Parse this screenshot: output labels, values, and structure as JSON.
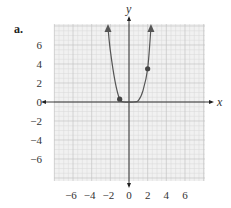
{
  "part_label": "a.",
  "chart_data": {
    "type": "line",
    "title": "",
    "xlabel": "x",
    "ylabel": "y",
    "xlim": [
      -8,
      8
    ],
    "ylim": [
      -8,
      8
    ],
    "grid": true,
    "minor_grid_step": 0.5,
    "major_grid_step": 2,
    "x_ticks": [
      -6,
      -4,
      -2,
      0,
      2,
      4,
      6
    ],
    "x_tick_labels": [
      "−6",
      "−4",
      "−2",
      "0",
      "2",
      "4",
      "6"
    ],
    "y_ticks": [
      6,
      4,
      2,
      0,
      -2,
      -4,
      -6
    ],
    "y_tick_labels": [
      "6",
      "4",
      "2",
      "0",
      "−2",
      "−4",
      "−6"
    ],
    "series": [
      {
        "name": "curve",
        "color": "#555555",
        "arrows_both_ends": true,
        "x": [
          -2.25,
          -2.0,
          -1.5,
          -1.0,
          -0.5,
          0.0,
          0.5,
          1.0,
          1.5,
          2.0,
          2.35
        ],
        "y": [
          8.2,
          5.4,
          2.2,
          0.3,
          0.0,
          0.0,
          0.0,
          0.15,
          1.2,
          3.5,
          8.2
        ]
      }
    ],
    "points": [
      {
        "x": -1,
        "y": 0.3
      },
      {
        "x": 2,
        "y": 3.5
      }
    ]
  }
}
